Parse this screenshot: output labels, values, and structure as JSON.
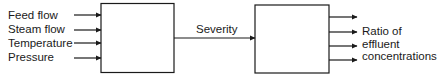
{
  "diagram": {
    "inputs": [
      {
        "label": "Feed flow"
      },
      {
        "label": "Steam flow"
      },
      {
        "label": "Temperature"
      },
      {
        "label": "Pressure"
      }
    ],
    "blocks": [
      {
        "id": "block-1",
        "label": ""
      },
      {
        "id": "block-2",
        "label": ""
      }
    ],
    "connection": {
      "label": "Severity"
    },
    "outputs": {
      "count": 4,
      "label_lines": [
        "Ratio of",
        "effluent",
        "concentrations"
      ]
    },
    "colors": {
      "stroke": "#1a1a1a",
      "background": "#ffffff"
    }
  }
}
